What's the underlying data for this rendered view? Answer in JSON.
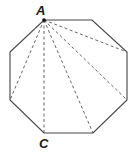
{
  "figure": {
    "shape": "regular octagon",
    "labels": {
      "top": "A",
      "bottom": "C"
    },
    "vertices": [
      [
        44,
        20
      ],
      [
        92,
        20
      ],
      [
        127,
        52
      ],
      [
        127,
        100
      ],
      [
        93,
        133
      ],
      [
        44,
        133
      ],
      [
        10,
        100
      ],
      [
        10,
        52
      ]
    ],
    "diagonals_from": "A",
    "diagonal_targets": [
      [
        127,
        52
      ],
      [
        127,
        100
      ],
      [
        93,
        133
      ],
      [
        44,
        133
      ],
      [
        10,
        100
      ]
    ],
    "colors": {
      "stroke": "#444444",
      "label": "#1a1a1a"
    }
  }
}
